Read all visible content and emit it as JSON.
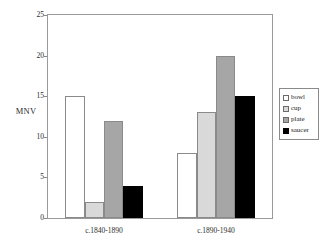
{
  "chart_data": {
    "type": "bar",
    "title": "",
    "subtitle": "",
    "xlabel": "",
    "ylabel": "MNV",
    "categories": [
      "c.1840-1890",
      "c.1890-1940"
    ],
    "series": [
      {
        "name": "bowl",
        "values": [
          15,
          8
        ],
        "color": "#ffffff"
      },
      {
        "name": "cup",
        "values": [
          2,
          13
        ],
        "color": "#d9d9d9"
      },
      {
        "name": "plate",
        "values": [
          12,
          20
        ],
        "color": "#a6a6a6"
      },
      {
        "name": "saucer",
        "values": [
          4,
          15
        ],
        "color": "#000000"
      }
    ],
    "ylim": [
      0,
      25
    ],
    "yticks": [
      "0",
      "5",
      "10",
      "15",
      "20",
      "25"
    ],
    "grid": false,
    "legend_position": "right",
    "legend_entries": [
      "bowl",
      "cup",
      "plate",
      "saucer"
    ],
    "annotations": []
  },
  "axis": {
    "y_label": "MNV",
    "ticks": [
      {
        "value": 25,
        "label": "25"
      },
      {
        "value": 20,
        "label": "20"
      },
      {
        "value": 15,
        "label": "15"
      },
      {
        "value": 10,
        "label": "10"
      },
      {
        "value": 5,
        "label": "5"
      },
      {
        "value": 0,
        "label": "0"
      }
    ]
  },
  "categories": [
    {
      "label": "c.1840-1890"
    },
    {
      "label": "c.1890-1940"
    }
  ],
  "legend": {
    "items": [
      {
        "label": "bowl"
      },
      {
        "label": "cup"
      },
      {
        "label": "plate"
      },
      {
        "label": "saucer"
      }
    ]
  },
  "colors": {
    "bowl": "#ffffff",
    "cup": "#d9d9d9",
    "plate": "#a6a6a6",
    "saucer": "#000000",
    "frame": "#9a9a9a",
    "text": "#1a1a1a"
  }
}
